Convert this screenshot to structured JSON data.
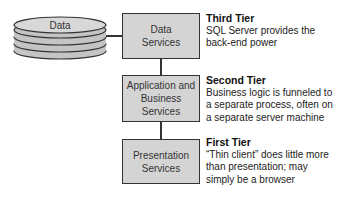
{
  "database": {
    "label": "Data"
  },
  "tiers": [
    {
      "box_label": "Data Services",
      "title": "Third Tier",
      "description": "SQL Server provides the back-end power"
    },
    {
      "box_label": "Application and Business Services",
      "title": "Second Tier",
      "description": "Business logic is funneled to a separate process, often on a separate server machine"
    },
    {
      "box_label": "Presentation Services",
      "title": "First Tier",
      "description": "“Thin client” does little more than presentation; may simply be a browser"
    }
  ],
  "colors": {
    "box_fill": "#d4d4d4",
    "stroke": "#333333",
    "disk_fill": "#c8c8c8"
  }
}
